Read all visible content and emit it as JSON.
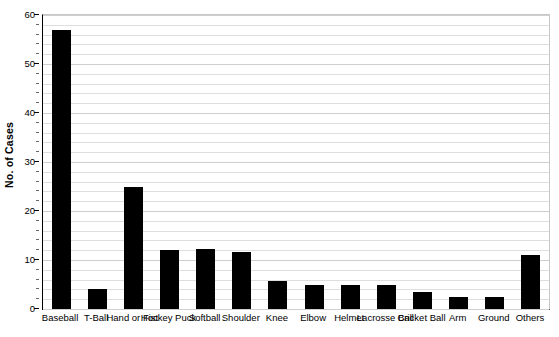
{
  "chart_data": {
    "type": "bar",
    "title": "",
    "xlabel": "",
    "ylabel": "No. of Cases",
    "ylim": [
      0,
      60
    ],
    "ytick_values": [
      0,
      10,
      20,
      30,
      40,
      50,
      60
    ],
    "ytick_labels": [
      "0",
      "10",
      "20",
      "30",
      "40",
      "50",
      "60"
    ],
    "minor_tick_step": 2,
    "grid": true,
    "legend": false,
    "categories": [
      "Baseball",
      "T-Ball",
      "Hand or Fist",
      "Hockey Puck",
      "Softball",
      "Shoulder",
      "Knee",
      "Elbow",
      "Helmet",
      "Lacrosse Ball",
      "Cricket Ball",
      "Arm",
      "Ground",
      "Others"
    ],
    "values": [
      57,
      4,
      25,
      12,
      12.3,
      11.6,
      5.8,
      4.8,
      4.8,
      5,
      3.5,
      2.5,
      2.5,
      11
    ],
    "bar_color": "#000000",
    "background_color": "#ffffff",
    "axis_color": "#000000",
    "gridline_color": "#dedede"
  }
}
